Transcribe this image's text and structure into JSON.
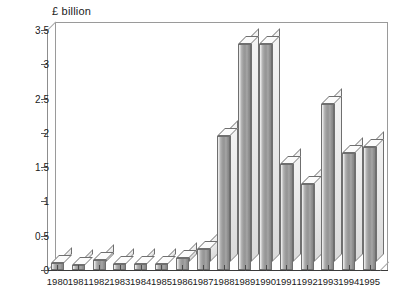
{
  "chart_data": {
    "type": "bar",
    "title": "",
    "ylabel": "£ billion",
    "xlabel": "",
    "ylim": [
      0,
      3.5
    ],
    "yticks": [
      "0",
      "0.5",
      "1",
      "1.5",
      "2",
      "2.5",
      "3",
      "3.5"
    ],
    "ytick_values": [
      0,
      0.5,
      1,
      1.5,
      2,
      2.5,
      3,
      3.5
    ],
    "grid": false,
    "legend": "none",
    "style": "3d-bar",
    "categories": [
      "1980",
      "1981",
      "1982",
      "1983",
      "1984",
      "1985",
      "1986",
      "1987",
      "1988",
      "1989",
      "1990",
      "1991",
      "1992",
      "1993",
      "1994",
      "1995"
    ],
    "values": [
      0.1,
      0.08,
      0.15,
      0.09,
      0.09,
      0.09,
      0.17,
      0.3,
      1.95,
      3.3,
      3.3,
      1.55,
      1.25,
      2.42,
      1.7,
      1.8
    ],
    "bar_color": "#9e9e9e",
    "bar_edge_color": "#6f6f6f",
    "axis_color": "#3a3a3a",
    "background": "#ffffff"
  }
}
